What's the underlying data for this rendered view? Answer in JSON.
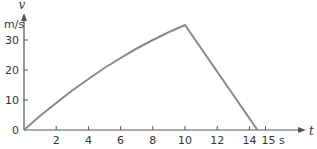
{
  "chart_data": {
    "type": "line",
    "title": "",
    "xlabel": "t",
    "x_unit": "s",
    "ylabel": "v",
    "y_unit": "m/s",
    "x_ticks": [
      2,
      4,
      6,
      8,
      10,
      12,
      14,
      15
    ],
    "x_tick_labels": [
      "2",
      "4",
      "6",
      "8",
      "10",
      "12",
      "14",
      "15 s"
    ],
    "y_ticks": [
      0,
      10,
      20,
      30
    ],
    "y_tick_labels": [
      "0",
      "10",
      "20",
      "30"
    ],
    "xlim": [
      0,
      16.5
    ],
    "ylim": [
      0,
      38
    ],
    "grid": false,
    "legend": null,
    "series": [
      {
        "name": "velocity",
        "color": "#888888",
        "x": [
          0,
          2,
          4,
          6,
          8,
          10,
          14.5
        ],
        "y": [
          0,
          9,
          17,
          24,
          30,
          35,
          0
        ]
      }
    ]
  },
  "colors": {
    "axis": "#555555",
    "line": "#888888",
    "text": "#333333"
  }
}
